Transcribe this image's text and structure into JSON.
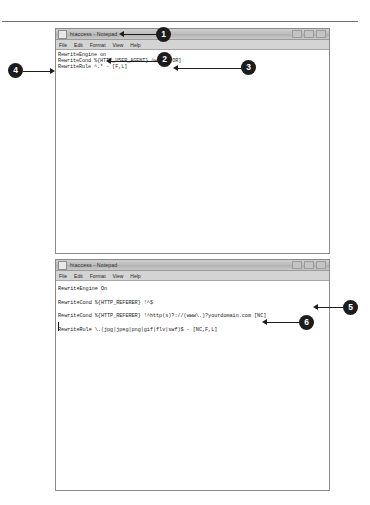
{
  "page": {
    "background_color": "#ffffff",
    "accent_color": "#1c1c1c"
  },
  "windows": [
    {
      "id": "window-1",
      "title": "htaccess - Notepad",
      "icon": "notepad-icon",
      "menu": [
        "File",
        "Edit",
        "Format",
        "View",
        "Help"
      ],
      "buttons": [
        "minimize",
        "maximize",
        "close"
      ],
      "lines": [
        "RewriteEngine on",
        "RewriteCond %{HTTP_USER_AGENT} ^wget [OR]",
        "RewriteRule ^.* - [F,L]"
      ]
    },
    {
      "id": "window-2",
      "title": "htaccess - Notepad",
      "icon": "notepad-icon",
      "menu": [
        "File",
        "Edit",
        "Format",
        "View",
        "Help"
      ],
      "buttons": [
        "minimize",
        "maximize",
        "close"
      ],
      "lines": [
        "RewriteEngine On",
        "RewriteCond %{HTTP_REFERER} !^$",
        "RewriteCond %{HTTP_REFERER} !^http(s)?://(www\\.)?yourdomain.com [NC]",
        "RewriteRule \\.(jpg|jpeg|png|gif|flv|swf)$ - [NC,F,L]"
      ]
    }
  ],
  "callouts": [
    {
      "number": "1",
      "target": "window-1-titlebar"
    },
    {
      "number": "2",
      "target": "window-1-line-1"
    },
    {
      "number": "3",
      "target": "window-1-line-2"
    },
    {
      "number": "4",
      "target": "window-1-line-3"
    },
    {
      "number": "5",
      "target": "window-2-line-3"
    },
    {
      "number": "6",
      "target": "window-2-line-4"
    }
  ]
}
